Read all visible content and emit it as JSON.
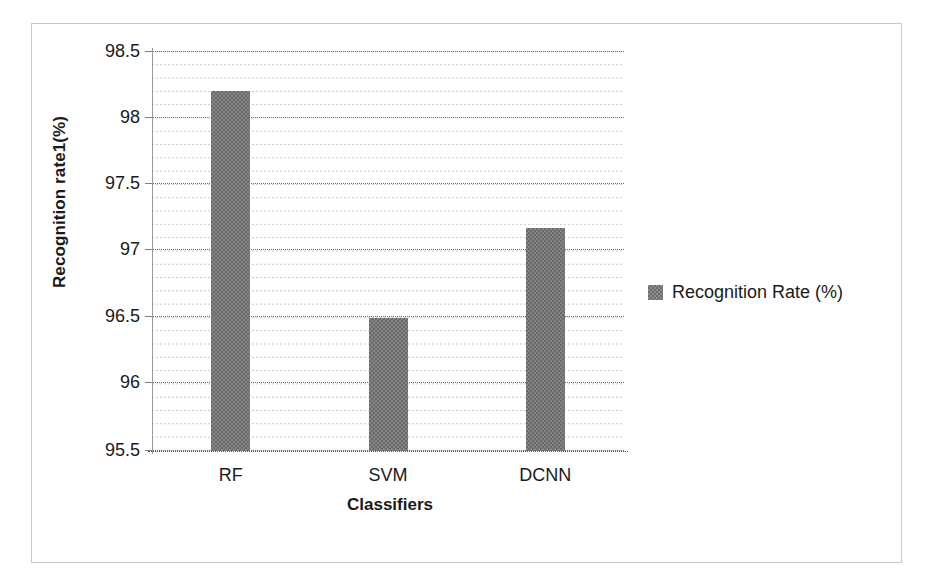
{
  "chart_data": {
    "type": "bar",
    "title": "",
    "categories": [
      "RF",
      "SVM",
      "DCNN"
    ],
    "values": [
      98.2,
      96.5,
      97.17
    ],
    "series": [
      {
        "name": "Recognition Rate (%)",
        "values": [
          98.2,
          96.5,
          97.17
        ]
      }
    ],
    "xlabel": "Classifiers",
    "ylabel": "Recognition rate1(%)",
    "ylim": [
      95.5,
      98.5
    ],
    "ytick_labels": [
      "98.5",
      "98",
      "97.5",
      "97",
      "96.5",
      "96",
      "95.5"
    ],
    "ytick_values": [
      98.5,
      98,
      97.5,
      97,
      96.5,
      96,
      95.5
    ],
    "ytick_step": 0.5,
    "minor_gridline_step": 0.1,
    "grid": true,
    "grid_style": "dotted",
    "legend": {
      "position": "right",
      "entries": [
        {
          "label": "Recognition Rate (%)",
          "swatch": "checkered-gray-square"
        }
      ]
    },
    "bar_color": "#848484",
    "bar_pattern": "checkerboard-dither",
    "frame_color": "#c8c8c8",
    "axis_color": "#9a9a9a",
    "text_color": "#1a1a1a"
  },
  "axes": {
    "y_title": "Recognition rate1(%)",
    "x_title": "Classifiers"
  },
  "legend": {
    "label": "Recognition Rate (%)"
  }
}
